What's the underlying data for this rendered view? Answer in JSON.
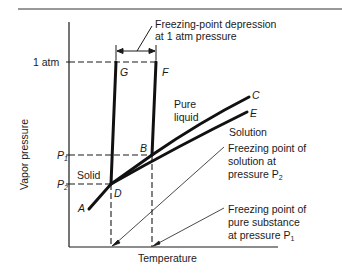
{
  "diagram": {
    "axes": {
      "ylabel": "Vapor pressure",
      "xlabel": "Temperature",
      "y_ticks": [
        "1 atm",
        "P1",
        "P2"
      ]
    },
    "points": {
      "A": "A",
      "B": "B",
      "C": "C",
      "D": "D",
      "E": "E",
      "F": "F",
      "G": "G"
    },
    "regions": {
      "solid": "Solid",
      "pure_liquid_1": "Pure",
      "pure_liquid_2": "liquid",
      "solution": "Solution"
    },
    "annotations": {
      "depression_1": "Freezing-point depression",
      "depression_2": "at 1 atm pressure",
      "solution_fp_1": "Freezing point of",
      "solution_fp_2": "solution at",
      "solution_fp_3": "pressure P",
      "solution_fp_sub": "2",
      "pure_fp_1": "Freezing point of",
      "pure_fp_2": "pure substance",
      "pure_fp_3": "at pressure P",
      "pure_fp_sub": "1"
    },
    "tick_labels": {
      "atm": "1 atm",
      "p1": "P",
      "p1_sub": "1",
      "p2": "P",
      "p2_sub": "2"
    }
  }
}
